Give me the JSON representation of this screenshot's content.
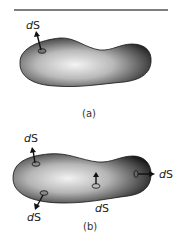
{
  "figure": {
    "top_rule": true,
    "panel_a": {
      "caption": "(a)",
      "labels": [
        {
          "d": "d",
          "s": "S",
          "x": 26,
          "y": 29
        }
      ]
    },
    "panel_b": {
      "caption": "(b)",
      "labels": [
        {
          "d": "d",
          "s": "S",
          "x": 24,
          "y": 142
        },
        {
          "d": "d",
          "s": "S",
          "x": 27,
          "y": 221
        },
        {
          "d": "d",
          "s": "S",
          "x": 95,
          "y": 212
        },
        {
          "d": "d",
          "s": "S",
          "x": 159,
          "y": 176
        }
      ]
    },
    "colors": {
      "shape_dark": "#1e1e1e",
      "shape_mid": "#8a8a8a",
      "shape_light": "#f2f2f2",
      "rule": "#555555"
    }
  }
}
